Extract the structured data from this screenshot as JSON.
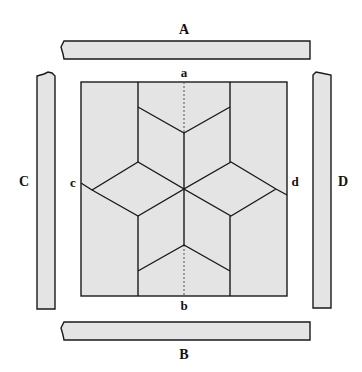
{
  "diagram": {
    "type": "quilt-block-with-borders",
    "colors": {
      "fill": "#e4e4e4",
      "stroke": "#1a1a1a",
      "background": "#ffffff"
    },
    "border_strips": {
      "top": {
        "label": "A"
      },
      "bottom": {
        "label": "B"
      },
      "left": {
        "label": "C"
      },
      "right": {
        "label": "D"
      }
    },
    "center_block": {
      "edge_labels": {
        "top": "a",
        "bottom": "b",
        "left": "c",
        "right": "d"
      },
      "pattern": "six-point star (LeMoyne-style) of diamonds",
      "center_line": "dashed vertical line a-b"
    }
  }
}
